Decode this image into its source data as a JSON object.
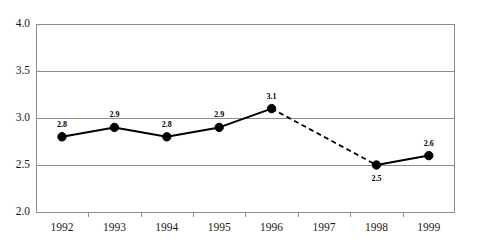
{
  "chart_data": {
    "type": "line",
    "title": "",
    "subtitle": "",
    "xlabel": "",
    "ylabel": "",
    "categories": [
      "1992",
      "1993",
      "1994",
      "1995",
      "1996",
      "1997",
      "1998",
      "1999"
    ],
    "values": [
      2.8,
      2.9,
      2.8,
      2.9,
      3.1,
      null,
      2.5,
      2.6
    ],
    "point_labels": [
      "2.8",
      "2.9",
      "2.8",
      "2.9",
      "3.1",
      "",
      "2.5",
      "2.6"
    ],
    "point_label_positions": [
      "above",
      "above",
      "above",
      "above",
      "above",
      "",
      "below",
      "above"
    ],
    "ylim": [
      2.0,
      4.0
    ],
    "yticks": [
      2.0,
      2.5,
      3.0,
      3.5,
      4.0
    ],
    "ytick_labels": [
      "2.0",
      "2.5",
      "3.0",
      "3.5",
      "4.0"
    ],
    "grid": true,
    "grid_axis": "y",
    "legend": "none",
    "series": [
      {
        "name": "series-1",
        "values": [
          2.8,
          2.9,
          2.8,
          2.9,
          3.1,
          null,
          2.5,
          2.6
        ],
        "marker": "filled-circle",
        "line_style_segments": [
          {
            "from": "1992",
            "to": "1993",
            "style": "solid"
          },
          {
            "from": "1993",
            "to": "1994",
            "style": "solid"
          },
          {
            "from": "1994",
            "to": "1995",
            "style": "solid"
          },
          {
            "from": "1995",
            "to": "1996",
            "style": "solid"
          },
          {
            "from": "1996",
            "to": "1998",
            "style": "dashed"
          },
          {
            "from": "1998",
            "to": "1999",
            "style": "solid"
          }
        ]
      }
    ],
    "colors": {
      "line": "#000000",
      "marker": "#000000",
      "gridline": "#8c8c8c",
      "axis": "#8c8c8c",
      "background": "#ffffff",
      "text": "#1a1a1a"
    }
  },
  "geometry": {
    "plot_left": 36,
    "plot_right": 455,
    "plot_top": 24,
    "plot_bottom": 212,
    "category_step": 52.4,
    "first_category_center": 62,
    "y_value_top": 4.0,
    "y_value_bottom": 2.0
  }
}
